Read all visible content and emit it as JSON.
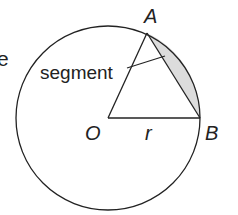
{
  "diagram": {
    "labels": {
      "A": "A",
      "B": "B",
      "O": "O",
      "r": "r",
      "segment": "segment",
      "cut_text": "e"
    },
    "colors": {
      "stroke": "#222222",
      "segment_fill": "#dcdcdc",
      "background": "#ffffff"
    }
  }
}
